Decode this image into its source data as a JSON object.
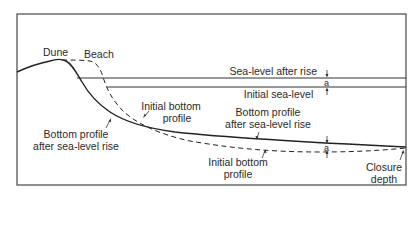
{
  "diagram": {
    "type": "coastal-profile",
    "labels": {
      "dune": "Dune",
      "beach": "Beach",
      "sea_level_after_rise": "Sea-level after rise",
      "initial_sea_level": "Initial sea-level",
      "initial_bottom_profile_upper_line1": "Initial bottom",
      "initial_bottom_profile_upper_line2": "profile",
      "bottom_profile_after_rise_left_line1": "Bottom profile",
      "bottom_profile_after_rise_left_line2": "after sea-level rise",
      "bottom_profile_after_rise_right_line1": "Bottom profile",
      "bottom_profile_after_rise_right_line2": "after sea-level rise",
      "initial_bottom_profile_lower_line1": "Initial bottom",
      "initial_bottom_profile_lower_line2": "profile",
      "rise_marker_top": "a",
      "rise_marker_bottom": "a",
      "closure_depth_line1": "Closure",
      "closure_depth_line2": "depth"
    },
    "colors": {
      "line": "#2a2a2a",
      "frame": "#555555",
      "background": "#ffffff"
    }
  }
}
